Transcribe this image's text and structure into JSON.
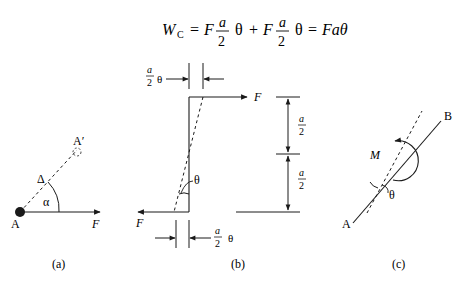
{
  "equation": {
    "lhs": "W",
    "lhs_sub": "C",
    "eq1": "=",
    "F1": "F",
    "frac1_num": "a",
    "frac1_den": "2",
    "theta1": "θ",
    "plus": "+",
    "F2": "F",
    "frac2_num": "a",
    "frac2_den": "2",
    "theta2": "θ",
    "eq2": "=",
    "rhs": "Faθ"
  },
  "panel_a": {
    "caption": "(a)",
    "point_A": "A",
    "point_A_prime": "A′",
    "delta_label": "Δ",
    "alpha_label": "α",
    "force_label": "F"
  },
  "panel_b": {
    "caption": "(b)",
    "top_force_label": "F",
    "bottom_force_label": "F",
    "theta_label": "θ",
    "top_dim_num": "a",
    "top_dim_den": "2",
    "top_dim_theta": "θ",
    "bottom_dim_num": "a",
    "bottom_dim_den": "2",
    "bottom_dim_theta": "θ",
    "right_dim_upper_num": "a",
    "right_dim_upper_den": "2",
    "right_dim_lower_num": "a",
    "right_dim_lower_den": "2"
  },
  "panel_c": {
    "caption": "(c)",
    "point_A": "A",
    "point_B": "B",
    "moment_label": "M",
    "theta_label": "θ"
  }
}
